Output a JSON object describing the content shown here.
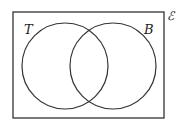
{
  "diagram": {
    "type": "venn",
    "universal_set_label": "ℰ",
    "sets": [
      {
        "label": "T",
        "cx": 65,
        "cy": 66,
        "r": 43
      },
      {
        "label": "B",
        "cx": 113,
        "cy": 66,
        "r": 43
      }
    ],
    "frame": {
      "x": 13,
      "y": 12,
      "width": 151,
      "height": 106
    },
    "stroke_color": "#333333"
  }
}
